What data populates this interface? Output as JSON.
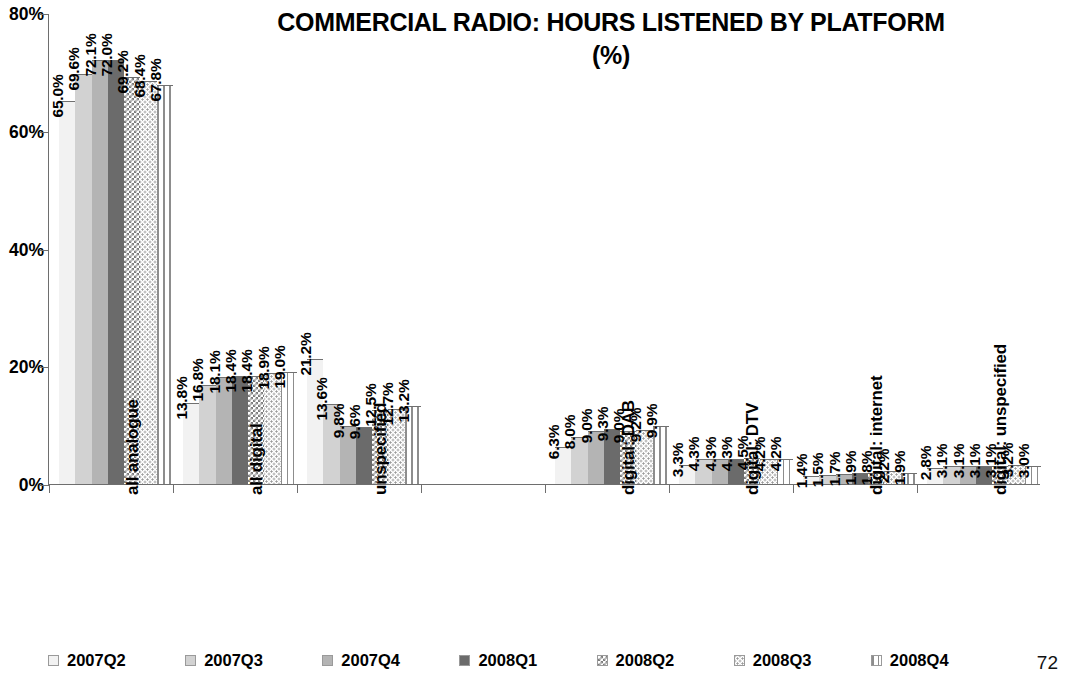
{
  "chart_data": {
    "type": "bar",
    "title": "COMMERCIAL RADIO: HOURS LISTENED BY PLATFORM",
    "title_line2": "(%)",
    "xlabel": "",
    "ylabel": "",
    "ylim": [
      0,
      80
    ],
    "ytick_labels": [
      "0%",
      "20%",
      "40%",
      "60%",
      "80%"
    ],
    "ytick_values": [
      0,
      20,
      40,
      60,
      80
    ],
    "grid": false,
    "legend_position": "bottom",
    "value_label_suffix": "%",
    "categories": [
      "all analogue",
      "all digital",
      "unspecified",
      "",
      "digital: DAB",
      "digital: DTV",
      "digital: internet",
      "digital: unspecified"
    ],
    "series": [
      {
        "name": "2007Q2",
        "values": [
          65.0,
          13.8,
          21.2,
          null,
          6.3,
          3.3,
          1.4,
          2.8
        ]
      },
      {
        "name": "2007Q3",
        "values": [
          69.6,
          16.8,
          13.6,
          null,
          8.0,
          4.3,
          1.5,
          3.1
        ]
      },
      {
        "name": "2007Q4",
        "values": [
          72.1,
          18.1,
          9.8,
          null,
          9.0,
          4.3,
          1.7,
          3.1
        ]
      },
      {
        "name": "2008Q1",
        "values": [
          72.0,
          18.4,
          9.6,
          null,
          9.3,
          4.3,
          1.9,
          3.1
        ]
      },
      {
        "name": "2008Q2",
        "values": [
          69.2,
          18.4,
          12.5,
          null,
          9.0,
          4.5,
          1.8,
          3.1
        ]
      },
      {
        "name": "2008Q3",
        "values": [
          68.4,
          18.9,
          12.7,
          null,
          9.2,
          4.2,
          2.2,
          3.2
        ]
      },
      {
        "name": "2008Q4",
        "values": [
          67.8,
          19.0,
          13.2,
          null,
          9.9,
          4.2,
          1.9,
          3.0
        ]
      }
    ],
    "value_labels": [
      [
        "65.0%",
        "69.6%",
        "72.1%",
        "72.0%",
        "69.2%",
        "68.4%",
        "67.8%"
      ],
      [
        "13.8%",
        "16.8%",
        "18.1%",
        "18.4%",
        "18.4%",
        "18.9%",
        "19.0%"
      ],
      [
        "21.2%",
        "13.6%",
        "9.8%",
        "9.6%",
        "12.5%",
        "12.7%",
        "13.2%"
      ],
      [],
      [
        "6.3%",
        "8.0%",
        "9.0%",
        "9.3%",
        "9.0%",
        "9.2%",
        "9.9%"
      ],
      [
        "3.3%",
        "4.3%",
        "4.3%",
        "4.3%",
        "4.5%",
        "4.2%",
        "4.2%"
      ],
      [
        "1.4%",
        "1.5%",
        "1.7%",
        "1.9%",
        "1.8%",
        "2.2%",
        "1.9%"
      ],
      [
        "2.8%",
        "3.1%",
        "3.1%",
        "3.1%",
        "3.1%",
        "3.2%",
        "3.0%"
      ]
    ]
  },
  "legend": {
    "items": [
      {
        "label": "2007Q2",
        "pattern": "p1"
      },
      {
        "label": "2007Q3",
        "pattern": "p2"
      },
      {
        "label": "2007Q4",
        "pattern": "p3"
      },
      {
        "label": "2008Q1",
        "pattern": "p4"
      },
      {
        "label": "2008Q2",
        "pattern": "p5"
      },
      {
        "label": "2008Q3",
        "pattern": "p6"
      },
      {
        "label": "2008Q4",
        "pattern": "p7"
      }
    ]
  },
  "footer": {
    "page_number": "72"
  }
}
